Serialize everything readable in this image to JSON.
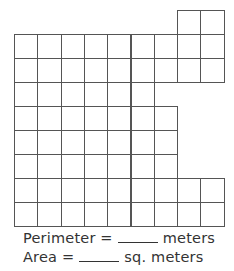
{
  "worksheet": {
    "grid": {
      "origin_x": 14,
      "origin_y": 10,
      "cell_w": 23.3,
      "cell_h": 24,
      "line_color": "#555555",
      "rows": [
        {
          "row": 0,
          "start_col": 7,
          "end_col": 8
        },
        {
          "row": 1,
          "start_col": 0,
          "end_col": 8
        },
        {
          "row": 2,
          "start_col": 0,
          "end_col": 8
        },
        {
          "row": 3,
          "start_col": 0,
          "end_col": 5
        },
        {
          "row": 4,
          "start_col": 0,
          "end_col": 6
        },
        {
          "row": 5,
          "start_col": 0,
          "end_col": 6
        },
        {
          "row": 6,
          "start_col": 0,
          "end_col": 6
        },
        {
          "row": 7,
          "start_col": 0,
          "end_col": 8
        },
        {
          "row": 8,
          "start_col": 0,
          "end_col": 8
        }
      ]
    },
    "perimeter": {
      "label": "Perimeter =",
      "unit": "meters"
    },
    "area": {
      "label": "Area =",
      "unit": "sq. meters"
    }
  }
}
